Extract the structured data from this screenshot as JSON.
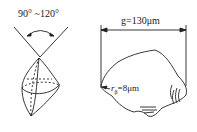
{
  "left_figure": {
    "title": "Grain tip angle",
    "angle_label": "90° ~120°"
  },
  "right_figure": {
    "title": "Abrasive grain",
    "width_label": "g=130μm",
    "radius_label_prefix": "r",
    "radius_label_sub": "β",
    "radius_label_suffix": "=8μm"
  },
  "colors": {
    "stroke": "#222222",
    "background": "#ffffff"
  }
}
